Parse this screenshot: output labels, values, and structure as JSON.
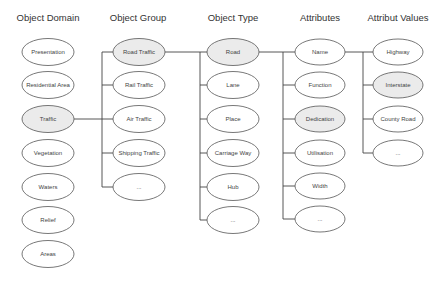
{
  "diagram": {
    "colors": {
      "highlight_fill": "#ebebeb",
      "normal_fill": "#ffffff",
      "stroke": "#555555"
    },
    "columns": [
      {
        "header": "Object Domain",
        "items": [
          {
            "label": "Presentation",
            "highlighted": false
          },
          {
            "label": "Residential Area",
            "highlighted": false
          },
          {
            "label": "Traffic",
            "highlighted": true
          },
          {
            "label": "Vegetation",
            "highlighted": false
          },
          {
            "label": "Waters",
            "highlighted": false
          },
          {
            "label": "Relief",
            "highlighted": false
          },
          {
            "label": "Areas",
            "highlighted": false
          }
        ]
      },
      {
        "header": "Object Group",
        "items": [
          {
            "label": "Road Traffic",
            "highlighted": true
          },
          {
            "label": "Rail Traffic",
            "highlighted": false
          },
          {
            "label": "Air Traffic",
            "highlighted": false
          },
          {
            "label": "Shipping Traffic",
            "highlighted": false
          },
          {
            "label": "...",
            "highlighted": false
          }
        ]
      },
      {
        "header": "Object Type",
        "items": [
          {
            "label": "Road",
            "highlighted": true
          },
          {
            "label": "Lane",
            "highlighted": false
          },
          {
            "label": "Place",
            "highlighted": false
          },
          {
            "label": "Carriage Way",
            "highlighted": false
          },
          {
            "label": "Hub",
            "highlighted": false
          },
          {
            "label": "...",
            "highlighted": false
          }
        ]
      },
      {
        "header": "Attributes",
        "items": [
          {
            "label": "Name",
            "highlighted": false
          },
          {
            "label": "Function",
            "highlighted": false
          },
          {
            "label": "Dedication",
            "highlighted": true
          },
          {
            "label": "Utilisation",
            "highlighted": false
          },
          {
            "label": "Width",
            "highlighted": false
          },
          {
            "label": "...",
            "highlighted": false
          }
        ]
      },
      {
        "header": "Attribut Values",
        "items": [
          {
            "label": "Highway",
            "highlighted": false
          },
          {
            "label": "Interstate",
            "highlighted": true
          },
          {
            "label": "County Road",
            "highlighted": false
          },
          {
            "label": "...",
            "highlighted": false
          }
        ]
      }
    ],
    "connections": [
      {
        "from": "Traffic",
        "to_column": "Object Group"
      },
      {
        "from": "Road Traffic",
        "to_column": "Object Type"
      },
      {
        "from": "Road",
        "to_column": "Attributes"
      },
      {
        "from": "Name",
        "to_column": "Attribut Values"
      }
    ]
  }
}
